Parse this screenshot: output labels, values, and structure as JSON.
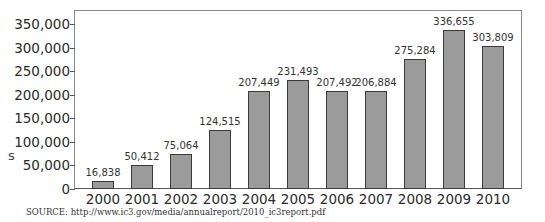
{
  "chart_data": {
    "type": "bar",
    "title": "",
    "xlabel": "",
    "ylabel": "",
    "categories": [
      "2000",
      "2001",
      "2002",
      "2003",
      "2004",
      "2005",
      "2006",
      "2007",
      "2008",
      "2009",
      "2010"
    ],
    "values": [
      16838,
      50412,
      75064,
      124515,
      207449,
      231493,
      207492,
      206884,
      275284,
      336655,
      303809
    ],
    "value_labels": [
      "16,838",
      "50,412",
      "75,064",
      "124,515",
      "207,449",
      "231,493",
      "207,492",
      "206,884",
      "275,284",
      "336,655",
      "303,809"
    ],
    "yticks": [
      0,
      50000,
      100000,
      150000,
      200000,
      250000,
      300000,
      350000
    ],
    "ytick_labels": [
      "0",
      "50,000",
      "100,000",
      "150,000",
      "200,000",
      "250,000",
      "300,000",
      "350,000"
    ],
    "ylim": [
      0,
      380000
    ],
    "grid": false,
    "legend": null,
    "bar_color": "#9b9b9b",
    "bar_edge_color": "#3a3a3a",
    "source": "SOURCE: http://www.ic3.gov/media/annualreport/2010_ic3report.pdf",
    "cropped_axis_label_fragment": "s"
  }
}
